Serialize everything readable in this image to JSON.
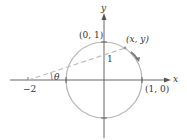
{
  "diagram": {
    "type": "unit-circle-stereographic-projection",
    "axes": {
      "x_label": "x",
      "y_label": "y"
    },
    "labels": {
      "top_point": "(0, 1)",
      "right_point": "(1, 0)",
      "moving_point": "(x, y)",
      "left_point": "−2",
      "angle": "θ",
      "unit_one": "1"
    },
    "colors": {
      "axis": "#555555",
      "circle": "#b5b5b5",
      "dashed_line": "#bcbcbc",
      "direction_arrow": "#777777",
      "text": "#333333"
    }
  }
}
